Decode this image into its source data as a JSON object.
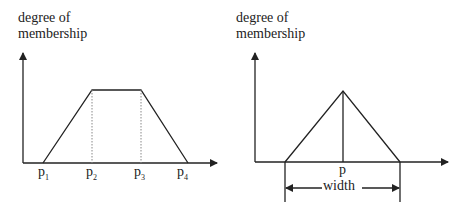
{
  "left_chart": {
    "ylabel_line1": "degree of",
    "ylabel_line2": "membership",
    "shape": "trapezoid",
    "ticks": [
      {
        "base": "p",
        "sub": "1"
      },
      {
        "base": "p",
        "sub": "2"
      },
      {
        "base": "p",
        "sub": "3"
      },
      {
        "base": "p",
        "sub": "4"
      }
    ]
  },
  "right_chart": {
    "ylabel_line1": "degree of",
    "ylabel_line2": "membership",
    "shape": "triangle",
    "center_label": "p",
    "width_label": "width"
  },
  "colors": {
    "line": "#222222",
    "dotted": "#888888",
    "background": "#ffffff"
  }
}
